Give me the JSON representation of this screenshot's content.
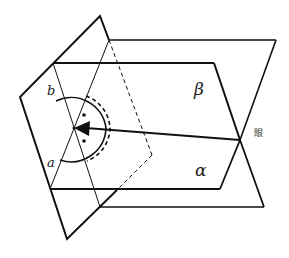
{
  "diagram": {
    "labels": {
      "beta": "β",
      "alpha": "α",
      "line_a": "a",
      "line_b": "b",
      "eye": "眼"
    },
    "colors": {
      "stroke": "#111111",
      "background": "#ffffff"
    },
    "elements": [
      {
        "name": "vertical-plane",
        "type": "quadrilateral"
      },
      {
        "name": "plane-beta",
        "type": "parallelogram"
      },
      {
        "name": "plane-alpha",
        "type": "parallelogram"
      },
      {
        "name": "line-a",
        "type": "line"
      },
      {
        "name": "line-b",
        "type": "line"
      },
      {
        "name": "angle-arc-solid",
        "type": "arc"
      },
      {
        "name": "angle-arc-dashed",
        "type": "arc"
      },
      {
        "name": "view-arrow",
        "type": "arrow",
        "from": "eye",
        "to": "vertex"
      },
      {
        "name": "right-angle-dots",
        "type": "marker",
        "count": 2
      }
    ]
  }
}
